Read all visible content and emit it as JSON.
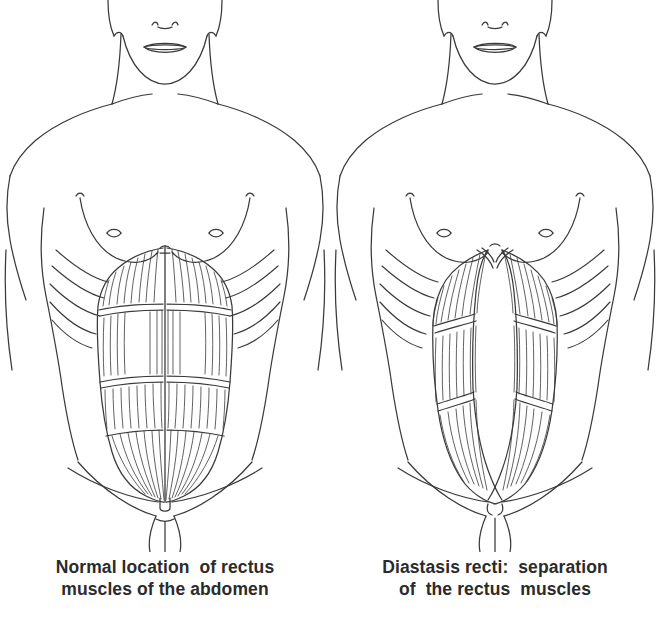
{
  "figure": {
    "name": "rectus-abdominis-comparison",
    "background_color": "#ffffff",
    "ink_color": "#3a3a3a",
    "caption_color": "#2b2b2b",
    "panel_count": 2
  },
  "panels": [
    {
      "id": "normal",
      "caption_lines": [
        "Normal location  of rectus",
        "muscles of the abdomen"
      ],
      "caption_full": "Normal location of rectus muscles of the abdomen",
      "anatomy": {
        "midline_label": "linea alba",
        "midline_gap_px": 0,
        "muscle_columns": 2,
        "tendinous_band_count": 3,
        "rib_arc_count": 5,
        "features": [
          "chin",
          "lips",
          "nostrils",
          "neck",
          "shoulders",
          "breasts",
          "nipples",
          "costal-margin-ribs",
          "rectus-abdominis-left",
          "rectus-abdominis-right",
          "linea-alba",
          "navel",
          "inguinal-creases",
          "pubic-area"
        ]
      }
    },
    {
      "id": "diastasis",
      "caption_lines": [
        "Diastasis recti:  separation",
        "of  the rectus  muscles"
      ],
      "caption_full": "Diastasis recti: separation of the rectus muscles",
      "anatomy": {
        "midline_label": "widened linea alba",
        "midline_gap_px": 38,
        "muscle_columns": 2,
        "tendinous_band_count": 2,
        "rib_arc_count": 5,
        "features": [
          "chin",
          "lips",
          "nostrils",
          "neck",
          "shoulders",
          "breasts",
          "nipples",
          "costal-margin-ribs",
          "rectus-abdominis-left-displaced",
          "rectus-abdominis-right-displaced",
          "separation-gap",
          "navel",
          "inguinal-creases",
          "pubic-area"
        ]
      }
    }
  ]
}
